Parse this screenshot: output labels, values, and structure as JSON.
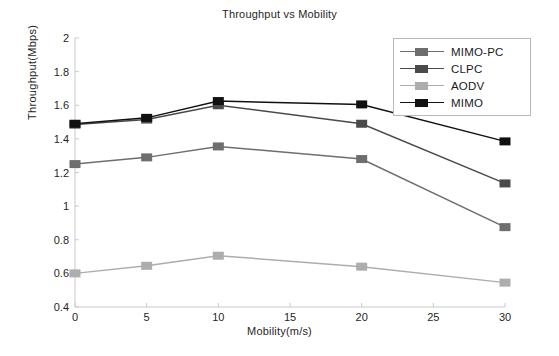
{
  "chart_data": {
    "type": "line",
    "title": "Throughput vs Mobility",
    "xlabel": "Mobility(m/s)",
    "ylabel": "Throughput(Mbps)",
    "x": [
      0,
      5,
      10,
      20,
      30
    ],
    "xlim": [
      0,
      30
    ],
    "ylim": [
      0.4,
      2
    ],
    "xticks": [
      0,
      5,
      10,
      15,
      20,
      25,
      30
    ],
    "yticks": [
      0.4,
      0.6,
      0.8,
      1,
      1.2,
      1.4,
      1.6,
      1.8,
      2
    ],
    "xticklabels": [
      "0",
      "5",
      "10",
      "15",
      "20",
      "25",
      "30"
    ],
    "yticklabels": [
      "0.4",
      "0.6",
      "0.8",
      "1",
      "1.2",
      "1.4",
      "1.6",
      "1.8",
      "2"
    ],
    "grid": false,
    "legend_position": "upper right",
    "series": [
      {
        "name": "MIMO-PC",
        "color": "#6e6e6e",
        "values": [
          1.25,
          1.29,
          1.355,
          1.28,
          0.875
        ]
      },
      {
        "name": "CLPC",
        "color": "#4a4a4a",
        "values": [
          1.485,
          1.515,
          1.6,
          1.49,
          1.135
        ]
      },
      {
        "name": "AODV",
        "color": "#adadad",
        "values": [
          0.6,
          0.645,
          0.705,
          0.64,
          0.545
        ]
      },
      {
        "name": "MIMO",
        "color": "#111111",
        "values": [
          1.49,
          1.525,
          1.625,
          1.605,
          1.385
        ]
      }
    ]
  },
  "legend": {
    "entries": [
      {
        "label": "MIMO-PC"
      },
      {
        "label": "CLPC"
      },
      {
        "label": "AODV"
      },
      {
        "label": "MIMO"
      }
    ]
  }
}
